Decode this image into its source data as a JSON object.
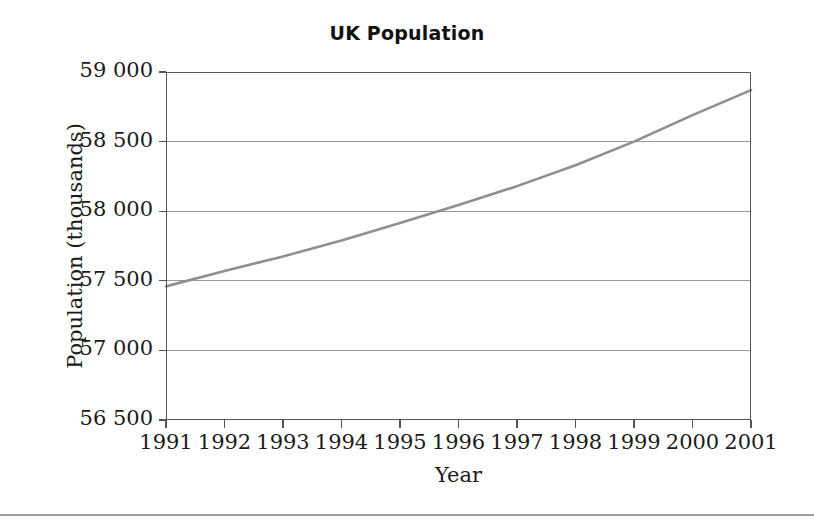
{
  "chart_data": {
    "type": "line",
    "title": "UK Population",
    "xlabel": "Year",
    "ylabel": "Population (thousands)",
    "x": [
      1991,
      1992,
      1993,
      1994,
      1995,
      1996,
      1997,
      1998,
      1999,
      2000,
      2001
    ],
    "xticklabels": [
      "1991",
      "1992",
      "1993",
      "1994",
      "1995",
      "1996",
      "1997",
      "1998",
      "1999",
      "2000",
      "2001"
    ],
    "values": [
      57460,
      57570,
      57675,
      57790,
      57915,
      58045,
      58180,
      58330,
      58500,
      58690,
      58870
    ],
    "series": [
      {
        "name": "UK Population",
        "values": [
          57460,
          57570,
          57675,
          57790,
          57915,
          58045,
          58180,
          58330,
          58500,
          58690,
          58870
        ]
      }
    ],
    "xlim": [
      1991,
      2001
    ],
    "ylim": [
      56500,
      59000
    ],
    "yticks": [
      56500,
      57000,
      57500,
      58000,
      58500,
      59000
    ],
    "yticklabels": [
      "56 500",
      "57 000",
      "57 500",
      "58 000",
      "58 500",
      "59 000"
    ],
    "grid": "horizontal",
    "legend": "none",
    "line_color": "#8f8f93",
    "grid_color": "#9a9a9a",
    "axis_color": "#555555",
    "background": "#ffffff"
  },
  "figure": {
    "bottom_rule_color": "#9d9d9d"
  }
}
